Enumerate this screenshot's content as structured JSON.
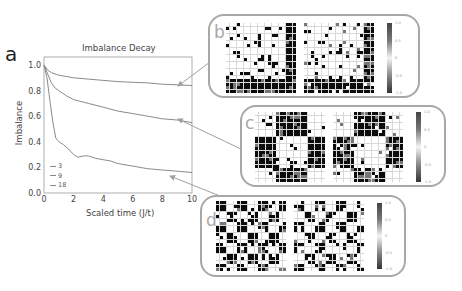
{
  "panel_a": {
    "label": "a",
    "title": "Imbalance Decay",
    "legend_title": ""
  },
  "panels": {
    "b": {
      "label": "b",
      "colorbar_ticks": [
        "1.0",
        "0.5",
        "0",
        "-0.5",
        "-1.0"
      ]
    },
    "c": {
      "label": "c",
      "colorbar_ticks": [
        "1.0",
        "0.5",
        "0",
        "-0.5",
        "-1.0"
      ]
    },
    "d": {
      "label": "d",
      "colorbar_ticks": [
        "1.0",
        "0.5",
        "0",
        "-0.5",
        "-1.0"
      ]
    }
  },
  "colors": {
    "line": "#8a8a8a",
    "axis": "#9a9a9a",
    "text": "#333333",
    "panel_border": "#a8a8a8",
    "arrow": "#a0a0a0"
  },
  "chart_data": {
    "type": "line",
    "title": "Imbalance Decay",
    "xlabel": "Scaled time (J/t)",
    "ylabel": "Imbalance",
    "xlim": [
      0,
      10
    ],
    "ylim": [
      0,
      1.05
    ],
    "xticks": [
      "0",
      "2",
      "4",
      "6",
      "8",
      "10"
    ],
    "yticks": [
      "0.0",
      "0.2",
      "0.4",
      "0.6",
      "0.8",
      "1.0"
    ],
    "grid": false,
    "legend_position": "lower left",
    "series": [
      {
        "name": "3",
        "x": [
          0,
          0.25,
          0.5,
          1,
          2,
          3,
          4,
          5,
          6,
          7,
          8,
          9,
          10
        ],
        "values": [
          1.0,
          0.96,
          0.94,
          0.92,
          0.9,
          0.89,
          0.88,
          0.87,
          0.865,
          0.86,
          0.85,
          0.845,
          0.84
        ]
      },
      {
        "name": "9",
        "x": [
          0,
          0.25,
          0.5,
          0.75,
          1,
          1.5,
          2,
          3,
          4,
          5,
          6,
          7,
          8,
          9,
          10
        ],
        "values": [
          1.0,
          0.93,
          0.86,
          0.82,
          0.8,
          0.76,
          0.73,
          0.7,
          0.67,
          0.64,
          0.62,
          0.6,
          0.58,
          0.57,
          0.55
        ]
      },
      {
        "name": "18",
        "x": [
          0,
          0.2,
          0.4,
          0.6,
          0.8,
          1.0,
          1.3,
          1.6,
          2.0,
          2.3,
          2.7,
          3.0,
          3.5,
          4.0,
          4.5,
          5.0,
          6.0,
          7.0,
          8.0,
          9.0,
          10.0
        ],
        "values": [
          1.0,
          0.9,
          0.72,
          0.55,
          0.43,
          0.4,
          0.38,
          0.35,
          0.3,
          0.28,
          0.29,
          0.29,
          0.27,
          0.26,
          0.25,
          0.23,
          0.21,
          0.19,
          0.18,
          0.17,
          0.16
        ]
      }
    ],
    "annotations": [
      {
        "text": "arrow from curve 3 to panel b"
      },
      {
        "text": "arrow from curve 9 to panel c"
      },
      {
        "text": "arrow from curve 18 to panel d"
      }
    ]
  }
}
